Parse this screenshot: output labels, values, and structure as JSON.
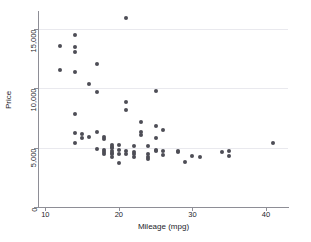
{
  "chart_data": {
    "type": "scatter",
    "title": "",
    "xlabel": "Mileage (mpg)",
    "ylabel": "Price",
    "xlim": [
      9,
      43
    ],
    "ylim": [
      0,
      16500
    ],
    "xticks": [
      10,
      20,
      30,
      40
    ],
    "xtick_labels": [
      "10",
      "20",
      "30",
      "40"
    ],
    "yticks": [
      0,
      5000,
      10000,
      15000
    ],
    "ytick_labels": [
      "0",
      "5,000",
      "10,000",
      "15,000"
    ],
    "grid": "horizontal",
    "legend": "none",
    "marker": {
      "shape": "circle",
      "color": "#4d4d56",
      "size": 4
    },
    "points": [
      {
        "x": 12,
        "y": 13594
      },
      {
        "x": 12,
        "y": 11497
      },
      {
        "x": 14,
        "y": 14500
      },
      {
        "x": 14,
        "y": 13466
      },
      {
        "x": 14,
        "y": 13050
      },
      {
        "x": 14,
        "y": 11385
      },
      {
        "x": 14,
        "y": 7827
      },
      {
        "x": 14,
        "y": 6229
      },
      {
        "x": 14,
        "y": 5397
      },
      {
        "x": 15,
        "y": 6165
      },
      {
        "x": 15,
        "y": 5788
      },
      {
        "x": 16,
        "y": 10372
      },
      {
        "x": 16,
        "y": 5899
      },
      {
        "x": 17,
        "y": 12044
      },
      {
        "x": 17,
        "y": 9690
      },
      {
        "x": 17,
        "y": 6295
      },
      {
        "x": 17,
        "y": 4890
      },
      {
        "x": 18,
        "y": 5886
      },
      {
        "x": 18,
        "y": 5705
      },
      {
        "x": 18,
        "y": 4816
      },
      {
        "x": 18,
        "y": 4589
      },
      {
        "x": 18,
        "y": 4482
      },
      {
        "x": 19,
        "y": 5222
      },
      {
        "x": 19,
        "y": 5079
      },
      {
        "x": 19,
        "y": 4934
      },
      {
        "x": 19,
        "y": 4723
      },
      {
        "x": 19,
        "y": 4504
      },
      {
        "x": 19,
        "y": 4424
      },
      {
        "x": 19,
        "y": 4172
      },
      {
        "x": 20,
        "y": 5189
      },
      {
        "x": 20,
        "y": 4757
      },
      {
        "x": 20,
        "y": 4424
      },
      {
        "x": 20,
        "y": 3667
      },
      {
        "x": 21,
        "y": 15906
      },
      {
        "x": 21,
        "y": 8814
      },
      {
        "x": 21,
        "y": 8129
      },
      {
        "x": 21,
        "y": 4733
      },
      {
        "x": 21,
        "y": 4482
      },
      {
        "x": 22,
        "y": 5104
      },
      {
        "x": 22,
        "y": 4647
      },
      {
        "x": 22,
        "y": 4425
      },
      {
        "x": 22,
        "y": 4172
      },
      {
        "x": 23,
        "y": 7140
      },
      {
        "x": 23,
        "y": 6295
      },
      {
        "x": 23,
        "y": 6079
      },
      {
        "x": 24,
        "y": 5172
      },
      {
        "x": 24,
        "y": 4499
      },
      {
        "x": 24,
        "y": 4187
      },
      {
        "x": 24,
        "y": 4060
      },
      {
        "x": 25,
        "y": 9735
      },
      {
        "x": 25,
        "y": 6850
      },
      {
        "x": 25,
        "y": 5798
      },
      {
        "x": 25,
        "y": 4816
      },
      {
        "x": 25,
        "y": 4741
      },
      {
        "x": 26,
        "y": 6486
      },
      {
        "x": 26,
        "y": 4723
      },
      {
        "x": 26,
        "y": 4389
      },
      {
        "x": 28,
        "y": 4748
      },
      {
        "x": 28,
        "y": 4647
      },
      {
        "x": 29,
        "y": 3798
      },
      {
        "x": 30,
        "y": 4296
      },
      {
        "x": 31,
        "y": 4195
      },
      {
        "x": 34,
        "y": 4647
      },
      {
        "x": 35,
        "y": 4697
      },
      {
        "x": 35,
        "y": 4296
      },
      {
        "x": 41,
        "y": 5397
      }
    ]
  }
}
